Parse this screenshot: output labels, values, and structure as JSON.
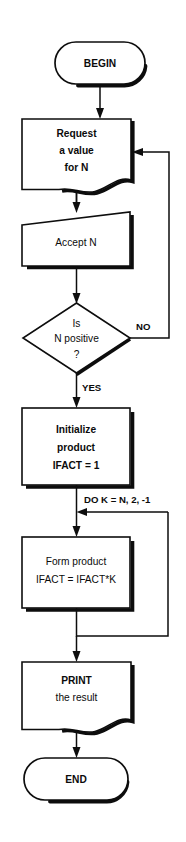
{
  "diagram": {
    "colors": {
      "background": "#ffffff",
      "stroke": "#0d0d0d",
      "text": "#0b0b0b"
    },
    "nodes": [
      {
        "id": "begin",
        "type": "terminator",
        "label": "BEGIN"
      },
      {
        "id": "request",
        "type": "document",
        "line1": "Request",
        "line2": "a value",
        "line3": "for N"
      },
      {
        "id": "accept",
        "type": "manual-input",
        "label": "Accept N"
      },
      {
        "id": "decision",
        "type": "decision",
        "line1": "Is",
        "line2": "N positive",
        "line3": "?"
      },
      {
        "id": "initialize",
        "type": "process",
        "line1": "Initialize",
        "line2": "product",
        "line3": "IFACT = 1"
      },
      {
        "id": "form",
        "type": "process",
        "line1": "Form product",
        "line2": "IFACT = IFACT*K"
      },
      {
        "id": "print",
        "type": "document",
        "line1": "PRINT",
        "line2": "the result"
      },
      {
        "id": "end",
        "type": "terminator",
        "label": "END"
      }
    ],
    "edge_labels": {
      "no": "NO",
      "yes": "YES",
      "do_loop": "DO  K = N, 2, -1"
    },
    "caption": ""
  }
}
